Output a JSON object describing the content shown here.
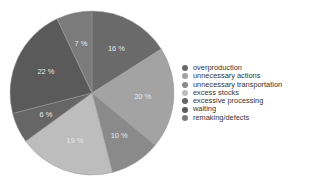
{
  "chart_data": {
    "type": "pie",
    "title": "",
    "categories": [
      "overproduction",
      "unnecessary actions",
      "unnecessary transportation",
      "excess stocks",
      "excessive processing",
      "waiting",
      "remaking/defects"
    ],
    "values": [
      16,
      20,
      10,
      19,
      6,
      22,
      7
    ],
    "labels": [
      "16 %",
      "20 %",
      "10 %",
      "19 %",
      "6 %",
      "22 %",
      "7 %"
    ],
    "colors": [
      "#6a6a6a",
      "#a3a3a3",
      "#8a8a8a",
      "#bdbdbd",
      "#666666",
      "#5a5a5a",
      "#7b7b7b"
    ],
    "start_angle_deg": 0,
    "direction": "clockwise",
    "legend_position": "right"
  },
  "legend": {
    "items": [
      {
        "label": "overproduction",
        "color": "#6a6a6a"
      },
      {
        "label": "unnecessary actions",
        "color": "#a3a3a3"
      },
      {
        "label": "unnecessary transportation",
        "color": "#8a8a8a"
      },
      {
        "label": "excess stocks",
        "color": "#bdbdbd"
      },
      {
        "label": "excessive processing",
        "color": "#666666"
      },
      {
        "label": "waiting",
        "color": "#5a5a5a"
      },
      {
        "label": "remaking/defects",
        "color": "#7b7b7b"
      }
    ]
  }
}
